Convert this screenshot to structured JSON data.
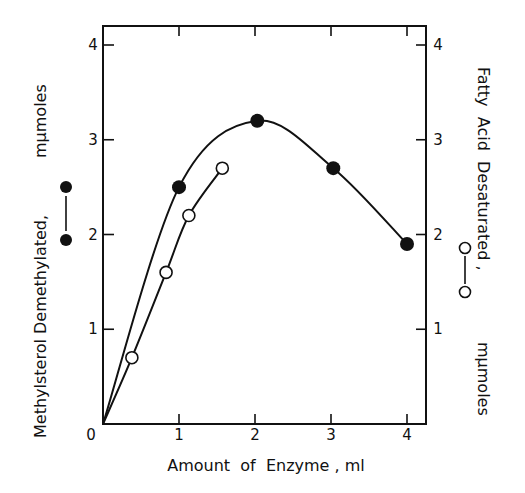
{
  "chart_data": {
    "type": "line",
    "title": "",
    "xlabel": "Amount of Enzyme , ml",
    "ylabel_left": "Methylsterol Demethylated,  mμmoles",
    "ylabel_right": "Fatty Acid Desaturated,  mμmoles",
    "xlim": [
      0,
      4.25
    ],
    "ylim": [
      0,
      4.2
    ],
    "x_ticks": [
      0,
      1,
      2,
      3,
      4
    ],
    "x_tick_labels": [
      "0",
      "1",
      "2",
      "3",
      "4"
    ],
    "y_ticks": [
      1,
      2,
      3,
      4
    ],
    "y_tick_labels": [
      "1",
      "2",
      "3",
      "4"
    ],
    "grid": false,
    "legend_position": "along axis labels (left: filled circles, right: open circles)",
    "series": [
      {
        "name": "Methylsterol Demethylated",
        "marker": "filled-circle",
        "axis": "left",
        "x": [
          0,
          1.0,
          2.03,
          3.03,
          4.0
        ],
        "values": [
          0,
          2.5,
          3.2,
          2.7,
          1.9
        ],
        "points_shown": [
          [
            1.0,
            2.5
          ],
          [
            2.03,
            3.2
          ],
          [
            3.03,
            2.7
          ],
          [
            4.0,
            1.9
          ]
        ]
      },
      {
        "name": "Fatty Acid Desaturated",
        "marker": "open-circle",
        "axis": "right",
        "x": [
          0,
          0.38,
          0.83,
          1.13,
          1.57
        ],
        "values": [
          0,
          0.7,
          1.6,
          2.2,
          2.7
        ],
        "points_shown": [
          [
            0.38,
            0.7
          ],
          [
            0.83,
            1.6
          ],
          [
            1.13,
            2.2
          ],
          [
            1.57,
            2.7
          ]
        ]
      }
    ]
  },
  "labels": {
    "x_axis": "Amount  of  Enzyme , ml",
    "left_axis": "Methylsterol Demethylated,",
    "left_units": "mμmoles",
    "right_axis": "Fatty  Acid  Desaturated ,",
    "right_units": "mμmoles",
    "origin": "0"
  }
}
